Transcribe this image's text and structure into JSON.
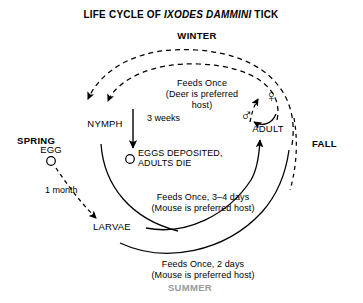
{
  "title": {
    "prefix": "LIFE CYCLE OF ",
    "species": "IXODES DAMMINI",
    "suffix": " TICK"
  },
  "colors": {
    "background": "#ffffff",
    "ink": "#000000",
    "summer_label": "#9a9a9a"
  },
  "seasons": [
    {
      "label": "WINTER"
    },
    {
      "label": "SPRING"
    },
    {
      "label": "FALL"
    },
    {
      "label": "SUMMER"
    }
  ],
  "stages": [
    {
      "label": "NYMPH"
    },
    {
      "label": "EGG"
    },
    {
      "label": "LARVAE"
    },
    {
      "label": "ADULT"
    }
  ],
  "events": {
    "eggs_deposited_line1": "EGGS DEPOSITED,",
    "eggs_deposited_line2": "ADULTS DIE"
  },
  "durations": [
    {
      "label": "3 weeks"
    },
    {
      "label": "1 month"
    }
  ],
  "feeding_notes": [
    {
      "line1": "Feeds Once",
      "line2": "(Deer is preferred",
      "line3": "host)"
    },
    {
      "line1": "Feeds Once, 3–4 days",
      "line2": "(Mouse is preferred host)"
    },
    {
      "line1": "Feeds Once, 2 days",
      "line2": "(Mouse is preferred host)"
    }
  ],
  "symbols": {
    "male": "♂",
    "female": "♀"
  },
  "icons": {
    "egg_marker": "egg-circle-icon",
    "eggs_marker": "eggs-circle-icon"
  }
}
